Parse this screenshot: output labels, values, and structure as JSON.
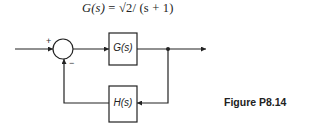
{
  "equation": {
    "lhs": "G(s)",
    "eq": " = ",
    "rhs": "√2/ (s + 1)"
  },
  "diagram": {
    "summing_junction": {
      "plus_sign": "+",
      "minus_sign": "−"
    },
    "forward_block": {
      "label": "G(s)"
    },
    "feedback_block": {
      "label": "H(s)"
    }
  },
  "caption": "Figure P8.14",
  "colors": {
    "stroke": "#222222",
    "background": "#ffffff"
  }
}
